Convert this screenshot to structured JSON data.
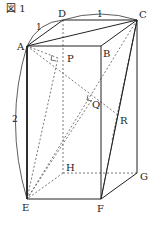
{
  "figure": {
    "title": "図 1"
  },
  "vertices": {
    "A": "A",
    "B": "B",
    "C": "C",
    "D": "D",
    "E": "E",
    "F": "F",
    "G": "G",
    "H": "H",
    "P": "P",
    "Q": "Q",
    "R": "R"
  },
  "dimensions": {
    "ad": "1",
    "dc": "1",
    "ae": "2"
  },
  "colors": {
    "line": "#222222",
    "dashed": "#555555"
  }
}
